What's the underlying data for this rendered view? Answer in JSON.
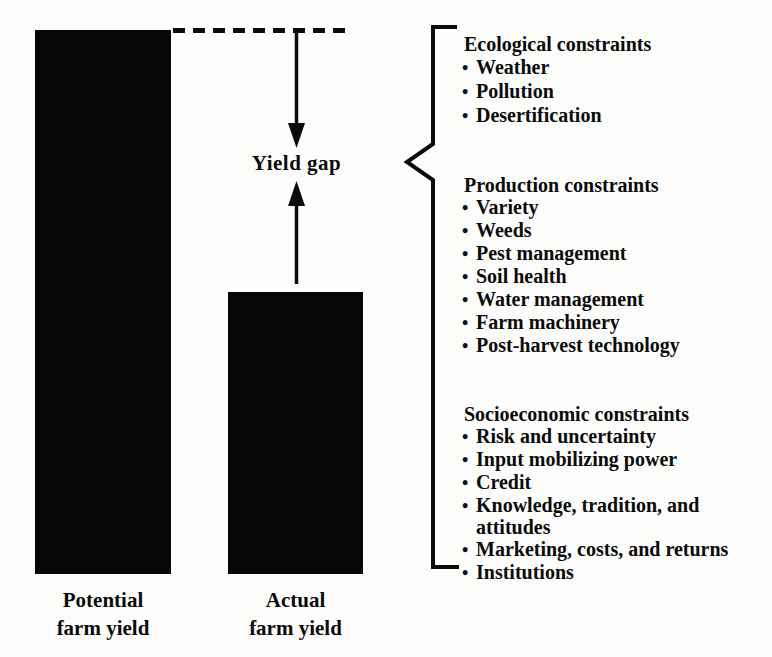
{
  "figure": {
    "ink_color": "#0b0b0b",
    "background_color": "#fdfdfc",
    "gap_label": "Yield gap"
  },
  "glyphs": {
    "bullet": "•"
  },
  "bars": [
    {
      "name": "potential",
      "label_line1": "Potential",
      "label_line2": "farm yield",
      "relative_height": "full"
    },
    {
      "name": "actual",
      "label_line1": "Actual",
      "label_line2": "farm yield",
      "relative_height": "about half"
    }
  ],
  "sections": [
    {
      "heading": "Ecological constraints",
      "items": [
        "Weather",
        "Pollution",
        "Desertification"
      ]
    },
    {
      "heading": "Production constraints",
      "items": [
        "Variety",
        "Weeds",
        "Pest management",
        "Soil health",
        "Water management",
        "Farm machinery",
        "Post-harvest technology"
      ]
    },
    {
      "heading": "Socioeconomic constraints",
      "items": [
        "Risk and uncertainty",
        "Input mobilizing power",
        "Credit",
        "Knowledge, tradition, and attitudes",
        "Marketing, costs, and returns",
        "Institutions"
      ]
    }
  ]
}
